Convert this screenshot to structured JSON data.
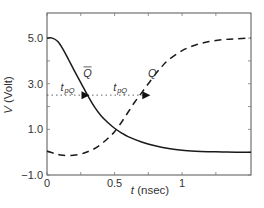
{
  "chart_data": {
    "type": "line",
    "title": "",
    "xlabel": "t (nsec)",
    "xlabel_var": "t",
    "xlabel_unit": " (nsec)",
    "ylabel": "V (Volt)",
    "ylabel_var": "V",
    "ylabel_unit": " (Volt)",
    "xlim": [
      0,
      1.51
    ],
    "ylim": [
      -1.0,
      6.1
    ],
    "x_ticks": [
      0,
      0.5,
      1
    ],
    "x_tick_labels": [
      "0",
      "0.5",
      "1"
    ],
    "x_minor_ticks": [
      0.25,
      0.75,
      1.25
    ],
    "y_ticks": [
      -1.0,
      1.0,
      3.0,
      5.0
    ],
    "y_tick_labels": [
      "−1.0",
      "1.0",
      "3.0",
      "5.0"
    ],
    "y_minor_ticks": [
      0.0,
      2.0,
      4.0
    ],
    "grid": false,
    "legend": null,
    "series": [
      {
        "name": "Q-bar",
        "style": "solid",
        "color": "#1a1a1a",
        "x": [
          0,
          0.04,
          0.08,
          0.12,
          0.16,
          0.2,
          0.25,
          0.3,
          0.35,
          0.4,
          0.45,
          0.5,
          0.55,
          0.6,
          0.7,
          0.8,
          0.9,
          1.0,
          1.1,
          1.2,
          1.3,
          1.4,
          1.51
        ],
        "y": [
          5.0,
          5.0,
          4.85,
          4.5,
          4.05,
          3.6,
          3.05,
          2.5,
          2.0,
          1.6,
          1.3,
          1.05,
          0.85,
          0.68,
          0.45,
          0.28,
          0.16,
          0.08,
          0.04,
          0.02,
          0.01,
          0.0,
          0.0
        ]
      },
      {
        "name": "Q",
        "style": "dashed",
        "color": "#1a1a1a",
        "x": [
          0,
          0.05,
          0.1,
          0.17,
          0.25,
          0.3,
          0.35,
          0.4,
          0.45,
          0.5,
          0.55,
          0.6,
          0.65,
          0.7,
          0.75,
          0.8,
          0.85,
          0.9,
          1.0,
          1.1,
          1.2,
          1.3,
          1.4,
          1.51
        ],
        "y": [
          0.05,
          -0.05,
          -0.12,
          -0.15,
          -0.08,
          0.02,
          0.15,
          0.35,
          0.6,
          0.9,
          1.3,
          1.75,
          2.2,
          2.6,
          3.0,
          3.4,
          3.75,
          4.05,
          4.45,
          4.7,
          4.85,
          4.93,
          4.97,
          5.0
        ]
      }
    ],
    "annotations": [
      {
        "text": "Q",
        "overbar": true,
        "x": 0.3,
        "y": 3.3
      },
      {
        "text": "Q",
        "overbar": false,
        "x": 0.78,
        "y": 3.3
      },
      {
        "text": "t",
        "sub": "pQ",
        "x": 0.1,
        "y": 2.7
      },
      {
        "text": "t",
        "sub": "pQ",
        "x": 0.49,
        "y": 2.7
      }
    ],
    "reference_line": {
      "y": 2.5,
      "style": "dotted",
      "x_from": 0,
      "x_to": 0.75
    },
    "arrows": [
      {
        "x": 0.3,
        "y": 2.5,
        "direction": "right"
      },
      {
        "x": 0.75,
        "y": 2.5,
        "direction": "right"
      }
    ]
  }
}
